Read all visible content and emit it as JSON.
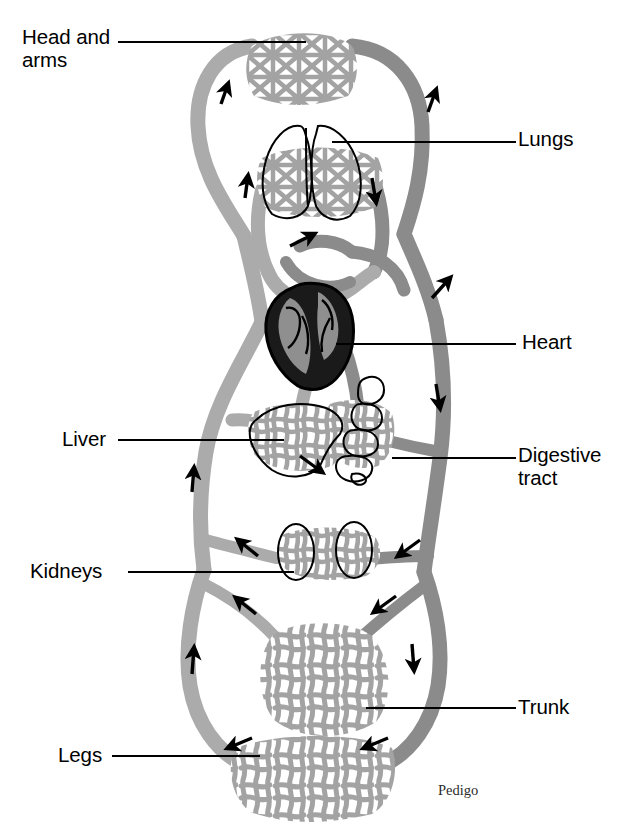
{
  "figure": {
    "credit": "Pedigo",
    "colors": {
      "artery_light_gray": "#ababab",
      "vein_dark_gray": "#8b8b8b",
      "capillary_gray": "#a3a3a3",
      "heart_fill": "#1a1a1a",
      "heart_chamber": "#8f8f8f",
      "outline": "#000000",
      "background": "#ffffff"
    }
  },
  "labels": [
    {
      "id": "head-and-arms",
      "text": "Head and\narms",
      "x": 22,
      "y": 26,
      "leader": "right"
    },
    {
      "id": "lungs",
      "text": "Lungs",
      "x": 518,
      "y": 128,
      "leader": "left"
    },
    {
      "id": "heart",
      "text": "Heart",
      "x": 522,
      "y": 331,
      "leader": "left"
    },
    {
      "id": "liver",
      "text": "Liver",
      "x": 62,
      "y": 428,
      "leader": "right"
    },
    {
      "id": "digestive-tract",
      "text": "Digestive\ntract",
      "x": 518,
      "y": 444,
      "leader": "left"
    },
    {
      "id": "kidneys",
      "text": "Kidneys",
      "x": 30,
      "y": 560,
      "leader": "right"
    },
    {
      "id": "trunk",
      "text": "Trunk",
      "x": 518,
      "y": 696,
      "leader": "left"
    },
    {
      "id": "legs",
      "text": "Legs",
      "x": 58,
      "y": 744,
      "leader": "right"
    }
  ],
  "regions": [
    {
      "id": "head-and-arms",
      "kind": "capillary-bed",
      "note": "top capillary mesh"
    },
    {
      "id": "lungs",
      "kind": "organ-outline",
      "note": "two-lobe lung outline over pulmonary capillary mesh"
    },
    {
      "id": "heart",
      "kind": "organ-filled",
      "note": "dark filled heart with gray chambers"
    },
    {
      "id": "liver",
      "kind": "organ-outline",
      "note": "liver outline over hepatic capillary mesh"
    },
    {
      "id": "digestive-tract",
      "kind": "organ-outline",
      "note": "lumpy intestinal tube outline over mesh"
    },
    {
      "id": "kidneys",
      "kind": "organ-outline",
      "note": "two kidney ovals over renal capillary mesh"
    },
    {
      "id": "trunk",
      "kind": "capillary-bed",
      "note": "large trunk capillary mesh"
    },
    {
      "id": "legs",
      "kind": "capillary-bed",
      "note": "bottom leg capillary mesh"
    }
  ],
  "flow_arrows": [
    {
      "id": "arrow-left-upper-neck",
      "x": 222,
      "y": 92,
      "dir": "up"
    },
    {
      "id": "arrow-right-upper-neck",
      "x": 432,
      "y": 100,
      "dir": "up"
    },
    {
      "id": "arrow-left-pulmonary",
      "x": 246,
      "y": 186,
      "dir": "up"
    },
    {
      "id": "arrow-right-pulmonary",
      "x": 374,
      "y": 190,
      "dir": "down"
    },
    {
      "id": "arrow-pulmonary-return",
      "x": 300,
      "y": 238,
      "dir": "up-right"
    },
    {
      "id": "arrow-right-aorta",
      "x": 440,
      "y": 286,
      "dir": "up-right"
    },
    {
      "id": "arrow-right-descend",
      "x": 438,
      "y": 396,
      "dir": "down"
    },
    {
      "id": "arrow-left-ascend",
      "x": 192,
      "y": 478,
      "dir": "up"
    },
    {
      "id": "arrow-portal",
      "x": 312,
      "y": 464,
      "dir": "down-right"
    },
    {
      "id": "arrow-left-renal",
      "x": 246,
      "y": 546,
      "dir": "up-left"
    },
    {
      "id": "arrow-right-renal",
      "x": 408,
      "y": 548,
      "dir": "down-left"
    },
    {
      "id": "arrow-left-iliac",
      "x": 244,
      "y": 604,
      "dir": "up-left"
    },
    {
      "id": "arrow-right-iliac",
      "x": 384,
      "y": 606,
      "dir": "down-left"
    },
    {
      "id": "arrow-left-leg",
      "x": 192,
      "y": 660,
      "dir": "up"
    },
    {
      "id": "arrow-right-leg",
      "x": 412,
      "y": 656,
      "dir": "down"
    },
    {
      "id": "arrow-left-foot",
      "x": 236,
      "y": 742,
      "dir": "left"
    },
    {
      "id": "arrow-right-foot",
      "x": 372,
      "y": 742,
      "dir": "left"
    }
  ]
}
